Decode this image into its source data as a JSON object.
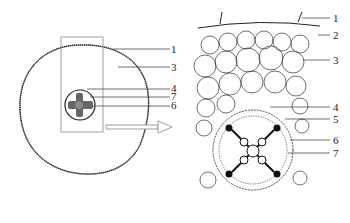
{
  "diagram": {
    "type": "root cross-section (overview and magnified detail)",
    "left_panel": {
      "description": "Whole root cross-section with selection rectangle",
      "labels": [
        {
          "text": "1",
          "y": 49
        },
        {
          "text": "3",
          "y": 67
        },
        {
          "text": "4",
          "y": 89
        },
        {
          "text": "7",
          "y": 97
        },
        {
          "text": "6",
          "y": 106
        }
      ]
    },
    "arrow": {
      "direction": "right",
      "meaning": "magnified view"
    },
    "right_panel": {
      "description": "Magnified cellular detail of selected region",
      "labels": [
        {
          "text": "1",
          "y": 18
        },
        {
          "text": "2",
          "y": 35
        },
        {
          "text": "3",
          "y": 60
        },
        {
          "text": "4",
          "y": 107
        },
        {
          "text": "5",
          "y": 119
        },
        {
          "text": "6",
          "y": 140
        },
        {
          "text": "7",
          "y": 153
        }
      ]
    },
    "colors": {
      "line": "#222222",
      "outline": "#888888",
      "xylem": "#111111"
    }
  }
}
